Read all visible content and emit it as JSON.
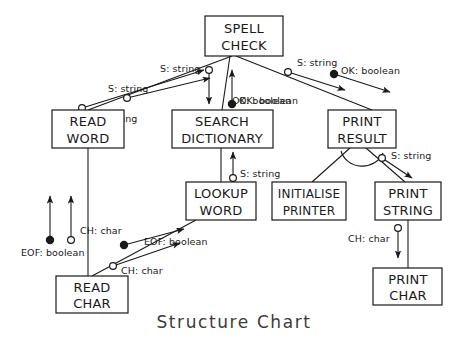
{
  "title": "Structure Chart",
  "diagram": {
    "type": "structure-chart",
    "modules": [
      {
        "id": "spell-check",
        "label_lines": [
          "SPELL",
          "CHECK"
        ],
        "x": 205,
        "y": 16,
        "w": 78,
        "h": 40
      },
      {
        "id": "read-word",
        "label_lines": [
          "READ",
          "WORD"
        ],
        "x": 52,
        "y": 110,
        "w": 72,
        "h": 38
      },
      {
        "id": "search-dictionary",
        "label_lines": [
          "SEARCH",
          "DICTIONARY"
        ],
        "x": 172,
        "y": 110,
        "w": 101,
        "h": 38
      },
      {
        "id": "print-result",
        "label_lines": [
          "PRINT",
          "RESULT"
        ],
        "x": 328,
        "y": 110,
        "w": 68,
        "h": 38
      },
      {
        "id": "lookup-word",
        "label_lines": [
          "LOOKUP",
          "WORD"
        ],
        "x": 186,
        "y": 182,
        "w": 70,
        "h": 38
      },
      {
        "id": "initialise-printer",
        "label_lines": [
          "INITIALISE",
          "PRINTER"
        ],
        "x": 272,
        "y": 182,
        "w": 74,
        "h": 38
      },
      {
        "id": "print-string",
        "label_lines": [
          "PRINT",
          "STRING"
        ],
        "x": 375,
        "y": 182,
        "w": 66,
        "h": 38
      },
      {
        "id": "read-char",
        "label_lines": [
          "READ",
          "CHAR"
        ],
        "x": 56,
        "y": 276,
        "w": 72,
        "h": 37
      },
      {
        "id": "print-char",
        "label_lines": [
          "PRINT",
          "CHAR"
        ],
        "x": 373,
        "y": 268,
        "w": 69,
        "h": 37
      }
    ],
    "connections": [
      {
        "id": "spell-check-to-read-word",
        "from": "spell-check",
        "to": "read-word"
      },
      {
        "id": "spell-check-to-search-dictionary",
        "from": "spell-check",
        "to": "search-dictionary"
      },
      {
        "id": "spell-check-to-print-result",
        "from": "spell-check",
        "to": "print-result"
      },
      {
        "id": "search-dictionary-to-lookup-word",
        "from": "search-dictionary",
        "to": "lookup-word"
      },
      {
        "id": "print-result-to-initialise",
        "from": "print-result",
        "to": "initialise-printer"
      },
      {
        "id": "print-result-to-print-string",
        "from": "print-result",
        "to": "print-string"
      },
      {
        "id": "read-word-to-read-char",
        "from": "read-word",
        "to": "read-char"
      },
      {
        "id": "print-string-to-print-char",
        "from": "print-string",
        "to": "print-char"
      }
    ],
    "couples": [
      {
        "id": "c1",
        "label": "S: string",
        "kind": "data",
        "marker": "hollow",
        "direction": "up",
        "on": "spell-check-to-read-word"
      },
      {
        "id": "c2",
        "label": "S: string",
        "kind": "data",
        "marker": "hollow",
        "direction": "up",
        "on": "spell-check-to-read-word"
      },
      {
        "id": "c3",
        "label": "S: string",
        "kind": "data",
        "marker": "hollow",
        "direction": "down",
        "on": "spell-check-to-search-dictionary"
      },
      {
        "id": "c4",
        "label": "OK: boolean",
        "kind": "control",
        "marker": "filled",
        "direction": "up",
        "on": "spell-check-to-search-dictionary"
      },
      {
        "id": "c5",
        "label": "S: string",
        "kind": "data",
        "marker": "hollow",
        "direction": "down",
        "on": "spell-check-to-print-result"
      },
      {
        "id": "c6",
        "label": "OK: boolean",
        "kind": "control",
        "marker": "filled",
        "direction": "down",
        "on": "spell-check-to-print-result"
      },
      {
        "id": "c7",
        "label": "S: string",
        "kind": "data",
        "marker": "hollow",
        "direction": "up",
        "on": "search-dictionary-to-lookup-word"
      },
      {
        "id": "c8",
        "label": "S: string",
        "kind": "data",
        "marker": "hollow",
        "direction": "down",
        "on": "print-result-to-print-string"
      },
      {
        "id": "c9",
        "label": "EOF: boolean",
        "kind": "control",
        "marker": "filled",
        "direction": "up",
        "on": "read-word-to-read-char"
      },
      {
        "id": "c10",
        "label": "CH: char",
        "kind": "data",
        "marker": "hollow",
        "direction": "up",
        "on": "read-word-to-read-char"
      },
      {
        "id": "c11",
        "label": "EOF: boolean",
        "kind": "control",
        "marker": "filled",
        "direction": "up",
        "on": "lookup-word-to-read-char"
      },
      {
        "id": "c12",
        "label": "CH: char",
        "kind": "data",
        "marker": "hollow",
        "direction": "up",
        "on": "lookup-word-to-read-char"
      },
      {
        "id": "c13",
        "label": "CH: char",
        "kind": "data",
        "marker": "hollow",
        "direction": "down",
        "on": "print-string-to-print-char"
      }
    ],
    "colors": {
      "line": "#1a1a1a",
      "box_fill": "#ffffff",
      "title": "#3b3b3b"
    }
  }
}
